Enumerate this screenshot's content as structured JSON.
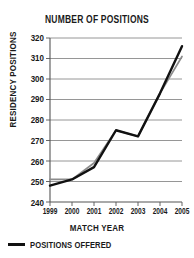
{
  "chart_data": {
    "type": "line",
    "title": "NUMBER OF POSITIONS",
    "xlabel": "MATCH YEAR",
    "ylabel": "RESIDENCY POSITIONS",
    "categories": [
      "1999",
      "2000",
      "2001",
      "2002",
      "2003",
      "2004",
      "2005"
    ],
    "x": [
      1999,
      2000,
      2001,
      2002,
      2003,
      2004,
      2005
    ],
    "ylim": [
      240,
      320
    ],
    "yticks": [
      240,
      250,
      260,
      270,
      280,
      290,
      300,
      310,
      320
    ],
    "grid": true,
    "legend_position": "bottom-left",
    "series": [
      {
        "name": "POSITIONS OFFERED",
        "color": "#111111",
        "values": [
          248,
          251,
          257,
          275,
          272,
          293,
          316
        ]
      },
      {
        "name": "",
        "color": "#8c8c8c",
        "values": [
          251,
          251,
          259,
          275,
          272,
          293,
          311
        ]
      }
    ],
    "legend": [
      {
        "label": "POSITIONS OFFERED",
        "color": "#111111"
      }
    ]
  },
  "colors": {
    "series_primary": "#111111",
    "series_secondary": "#8c8c8c",
    "axis": "#555555",
    "grid": "#8a8a8a",
    "text": "#1a1a1a",
    "background": "#ffffff"
  },
  "axis_labels": {
    "y": [
      "320",
      "310",
      "300",
      "290",
      "280",
      "270",
      "260",
      "250",
      "240"
    ],
    "x": [
      "1999",
      "2000",
      "2001",
      "2002",
      "2003",
      "2004",
      "2005"
    ]
  }
}
